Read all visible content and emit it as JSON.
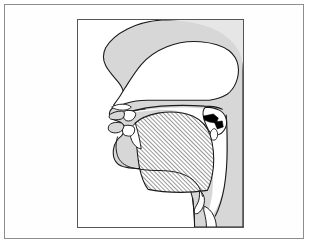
{
  "figure": {
    "title": "Mid-sagittal section of the human vocal tract",
    "type": "anatomical-sagittal-section",
    "colors": {
      "page_background": "#ffffff",
      "outer_frame_border": "#8d8d8d",
      "panel_border": "#555555",
      "panel_background": "#ffffff",
      "flesh_fill": "#d7d7d7",
      "skull_fill": "#e6e6e6",
      "cavity_fill": "#ffffff",
      "outline_stroke": "#1a1a1a",
      "hatch_stroke": "#262626",
      "velic_closure_fill": "#000000"
    },
    "layout": {
      "outer_frame": {
        "x": 4,
        "y": 4,
        "width": 300,
        "height": 235
      },
      "panel": {
        "x": 72,
        "y": 14,
        "width": 167,
        "height": 209
      }
    },
    "hatching": {
      "region": "tongue-body",
      "angle_degrees": 135,
      "spacing_px": 3,
      "stroke_width_px": 0.9
    },
    "structures": [
      {
        "name": "head-profile",
        "label": "Head profile and facial outline"
      },
      {
        "name": "nasal-cavity",
        "label": "Nasal cavity"
      },
      {
        "name": "nostril",
        "label": "Nostril"
      },
      {
        "name": "hard-palate",
        "label": "Hard palate"
      },
      {
        "name": "velum",
        "label": "Velum (soft palate), raised"
      },
      {
        "name": "velic-closure",
        "label": "Velic closure"
      },
      {
        "name": "uvula",
        "label": "Uvula"
      },
      {
        "name": "upper-lip",
        "label": "Upper lip"
      },
      {
        "name": "lower-lip",
        "label": "Lower lip"
      },
      {
        "name": "upper-teeth",
        "label": "Upper teeth"
      },
      {
        "name": "lower-teeth",
        "label": "Lower teeth"
      },
      {
        "name": "alveolar-ridge",
        "label": "Alveolar ridge"
      },
      {
        "name": "tongue-body",
        "label": "Tongue (hatched)"
      },
      {
        "name": "tongue-tip",
        "label": "Tongue tip"
      },
      {
        "name": "oral-cavity",
        "label": "Oral cavity"
      },
      {
        "name": "pharynx",
        "label": "Pharyngeal cavity"
      },
      {
        "name": "epiglottis",
        "label": "Epiglottis"
      },
      {
        "name": "larynx",
        "label": "Larynx"
      },
      {
        "name": "jaw",
        "label": "Jaw and chin"
      },
      {
        "name": "neck",
        "label": "Neck"
      },
      {
        "name": "skull-cranium",
        "label": "Cranium"
      }
    ]
  }
}
